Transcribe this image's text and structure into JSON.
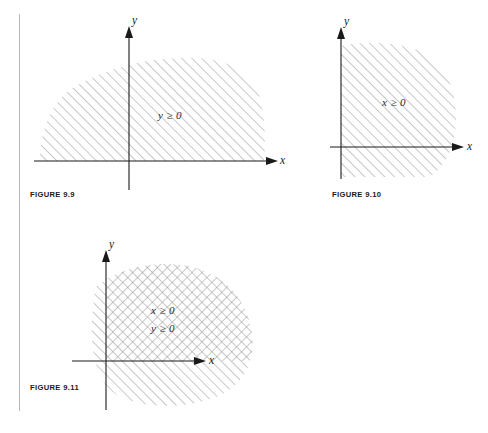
{
  "page": {
    "background_color": "#ffffff",
    "margin_rule_color": "#b9b9b9",
    "ink_color": "#1a1a1a",
    "hatch_color": "#9a9a9a"
  },
  "figures": [
    {
      "id": "figure-9-9",
      "caption": "FIGURE 9.9",
      "x_axis_label": "x",
      "y_axis_label": "y",
      "region_labels": [
        "y ≥ 0"
      ],
      "hatch_style": "single",
      "description_region": "half-plane above the x-axis"
    },
    {
      "id": "figure-9-10",
      "caption": "FIGURE 9.10",
      "x_axis_label": "x",
      "y_axis_label": "y",
      "region_labels": [
        "x ≥ 0"
      ],
      "hatch_style": "single",
      "description_region": "half-plane right of the y-axis"
    },
    {
      "id": "figure-9-11",
      "caption": "FIGURE 9.11",
      "x_axis_label": "x",
      "y_axis_label": "y",
      "region_labels": [
        "x ≥ 0",
        "y ≥ 0"
      ],
      "hatch_style": "cross",
      "description_region": "first quadrant intersection"
    }
  ]
}
